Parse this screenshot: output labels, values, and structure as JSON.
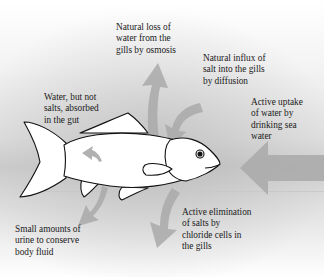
{
  "diagram": {
    "title": "",
    "colors": {
      "arrow": "#a9a9a9",
      "fish_fill": "#ffffff",
      "fish_outline": "#111111"
    },
    "labels": {
      "water_loss": "Natural loss of\nwater from the\ngills by osmosis",
      "salt_influx": "Natural influx of\nsalt into the gills\nby diffusion",
      "water_uptake": "Active uptake\nof water by\ndrinking sea\nwater",
      "gut_absorption": "Water, but not\nsalts, absorbed\nin the gut",
      "urine": "Small amounts of\nurine to conserve\nbody fluid",
      "salt_elimination": "Active elimination\nof salts by\nchloride cells in\nthe gills"
    }
  }
}
